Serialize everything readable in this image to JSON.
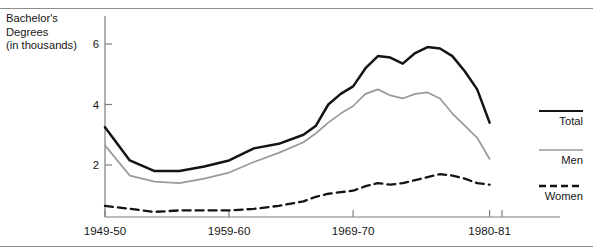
{
  "caption": {
    "line1": "Bachelor's",
    "line2": "Degrees",
    "line3": "(in thousands)"
  },
  "colors": {
    "total": "#141414",
    "men": "#9a9a9a",
    "women": "#141414",
    "axis": "#7d7d7d",
    "rule": "#8d8d8d",
    "text": "#161616"
  },
  "legend": {
    "items": [
      {
        "label": "Total",
        "style": "solid-thick",
        "color": "#141414"
      },
      {
        "label": "Men",
        "style": "solid-thin",
        "color": "#9a9a9a"
      },
      {
        "label": "Women",
        "style": "dashed",
        "color": "#141414"
      }
    ]
  },
  "chart_data": {
    "type": "line",
    "title": "Bachelor's Degrees (in thousands)",
    "xlabel": "",
    "ylabel": "Bachelor's Degrees (in thousands)",
    "grid": false,
    "legend_position": "right",
    "xlim": [
      1949,
      1981
    ],
    "ylim": [
      0,
      6.8
    ],
    "yticks": [
      2,
      4,
      6
    ],
    "ytick_labels": [
      "2",
      "4",
      "6"
    ],
    "xticks": [
      1949,
      1959,
      1969,
      1980
    ],
    "xtick_labels": [
      "1949-50",
      "1959-60",
      "1969-70",
      "1980-81"
    ],
    "x": [
      1949,
      1951,
      1953,
      1955,
      1957,
      1959,
      1961,
      1963,
      1965,
      1966,
      1967,
      1968,
      1969,
      1970,
      1971,
      1972,
      1973,
      1974,
      1975,
      1976,
      1977,
      1978,
      1979,
      1980
    ],
    "series": [
      {
        "name": "Total",
        "color": "#141414",
        "style": "solid-thick",
        "values": [
          3.25,
          2.15,
          1.8,
          1.8,
          1.95,
          2.15,
          2.55,
          2.7,
          3.0,
          3.3,
          4.0,
          4.35,
          4.6,
          5.2,
          5.6,
          5.55,
          5.35,
          5.7,
          5.9,
          5.85,
          5.6,
          5.1,
          4.5,
          3.4
        ]
      },
      {
        "name": "Men",
        "color": "#9a9a9a",
        "style": "solid-thin",
        "values": [
          2.65,
          1.65,
          1.45,
          1.4,
          1.55,
          1.75,
          2.1,
          2.4,
          2.75,
          3.05,
          3.4,
          3.7,
          3.95,
          4.35,
          4.5,
          4.3,
          4.2,
          4.35,
          4.4,
          4.2,
          3.7,
          3.3,
          2.9,
          2.2
        ]
      },
      {
        "name": "Women",
        "color": "#141414",
        "style": "dashed",
        "values": [
          0.65,
          0.55,
          0.45,
          0.5,
          0.5,
          0.5,
          0.55,
          0.65,
          0.8,
          0.95,
          1.05,
          1.1,
          1.15,
          1.3,
          1.4,
          1.35,
          1.4,
          1.5,
          1.6,
          1.7,
          1.65,
          1.55,
          1.4,
          1.35
        ]
      }
    ]
  }
}
